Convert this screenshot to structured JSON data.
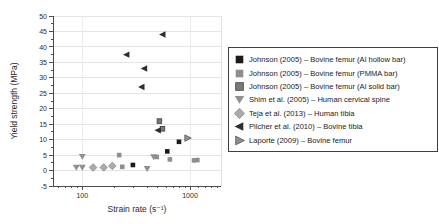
{
  "chart_data": {
    "type": "scatter",
    "title": "",
    "xlabel": "Strain rate (s⁻¹)",
    "ylabel": "Yield strength (MPa)",
    "x_scale": "log",
    "x_domain": [
      53,
      2000
    ],
    "ylim": [
      -5,
      50
    ],
    "grid": true,
    "legend_position": "right-outside",
    "x_major_ticks": [
      100,
      1000
    ],
    "x_minor_ticks": [
      60,
      70,
      80,
      90,
      200,
      300,
      400,
      500,
      600,
      700,
      800,
      900,
      1200,
      1400,
      1600,
      1800
    ],
    "y_major_ticks": [
      -5,
      0,
      5,
      10,
      15,
      20,
      25,
      30,
      35,
      40,
      45,
      50
    ],
    "y_minor_step": 2.5,
    "colors": {
      "axis": "#4d4d4d",
      "grid": "#e4e4e4",
      "tick_text": "#2b2b2b",
      "legend_border": "#3f3f3f"
    },
    "series": [
      {
        "name": "Johnson (2005) – Bovine femur (Al hollow bar)",
        "marker": "square",
        "color": "#1b1b1b",
        "stroke": "none",
        "points": [
          [
            295,
            1.8
          ],
          [
            615,
            6.2
          ],
          [
            790,
            9.3
          ]
        ]
      },
      {
        "name": "Johnson (2005) – Bovine femur (PMMA bar)",
        "marker": "square",
        "color": "#8e8e8e",
        "stroke": "none",
        "points": [
          [
            220,
            5.0
          ],
          [
            235,
            1.2
          ],
          [
            490,
            4.4
          ],
          [
            650,
            3.6
          ],
          [
            1090,
            3.3
          ],
          [
            1170,
            3.4
          ]
        ]
      },
      {
        "name": "Johnson (2005) – Bovine femur (Al solid bar)",
        "marker": "square",
        "color": "#7a7a7a",
        "stroke": "#3c3c3c",
        "points": [
          [
            520,
            16.0
          ],
          [
            555,
            13.5
          ]
        ]
      },
      {
        "name": "Shim et al. (2005) – Human cervical spine",
        "marker": "triangle-down",
        "color": "#909090",
        "stroke": "none",
        "points": [
          [
            88,
            1.0
          ],
          [
            100,
            1.0
          ],
          [
            100,
            4.5
          ],
          [
            400,
            0.6
          ],
          [
            460,
            4.4
          ]
        ]
      },
      {
        "name": "Teja et al. (2013) – Human tibia",
        "marker": "diamond",
        "color": "#ababab",
        "stroke": "#8a8a8a",
        "points": [
          [
            126,
            1.0
          ],
          [
            158,
            1.0
          ],
          [
            190,
            1.5
          ]
        ]
      },
      {
        "name": "Pilcher et al. (2010) – Bovine tibia",
        "marker": "triangle-left",
        "color": "#2e2e2e",
        "stroke": "none",
        "points": [
          [
            258,
            37.5
          ],
          [
            356,
            27.0
          ],
          [
            377,
            33.0
          ],
          [
            505,
            13.0
          ],
          [
            558,
            44.0
          ]
        ]
      },
      {
        "name": "Laporte (2009) – Bovine femur",
        "marker": "triangle-right",
        "color": "#8e8e8e",
        "stroke": "#555555",
        "points": [
          [
            950,
            10.5
          ]
        ]
      }
    ]
  }
}
